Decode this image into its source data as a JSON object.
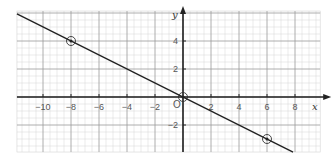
{
  "chart_data": {
    "type": "line",
    "title": "",
    "xlabel": "x",
    "ylabel": "y",
    "origin_label": "O",
    "xlim": [
      -11.86,
      9.8
    ],
    "ylim": [
      -3.93,
      6.14
    ],
    "grid": true,
    "minor_grid_step": 0.5,
    "major_grid_step": 2,
    "x_ticks": [
      -10,
      -8,
      -6,
      -4,
      -2,
      2,
      4,
      6,
      8
    ],
    "x_tick_labels": [
      "−10",
      "−8",
      "−6",
      "−4",
      "−2",
      "2",
      "4",
      "6",
      "8"
    ],
    "y_ticks": [
      4,
      2,
      -2
    ],
    "y_tick_labels": [
      "4",
      "2",
      "−2"
    ],
    "series": [
      {
        "name": "y = -x/2",
        "equation": "y = -1/2 x",
        "x": [
          -11.86,
          7.86
        ],
        "y": [
          5.93,
          -3.93
        ]
      }
    ],
    "marked_points": [
      {
        "x": -8,
        "y": 4
      },
      {
        "x": 0,
        "y": 0
      },
      {
        "x": 6,
        "y": -3
      }
    ],
    "colors": {
      "line": "#222222",
      "axis": "#222222",
      "major_grid": "#9a9a9a",
      "minor_grid": "#d4d4d4"
    }
  }
}
